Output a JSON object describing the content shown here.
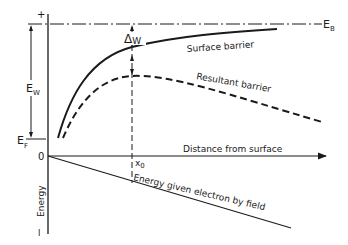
{
  "diagram": {
    "labels": {
      "plus": "+",
      "minus": "I",
      "e_b_main": "E",
      "e_b_sub": "B",
      "e_w_main": "E",
      "e_w_sub": "W",
      "e_f_main": "E",
      "e_f_sub": "F",
      "delta_main": "Δ",
      "delta_sub": "W",
      "zero": "0",
      "x0_main": "x",
      "x0_sub": "0",
      "energy_axis": "Energy",
      "surface_barrier": "Surface barrier",
      "resultant_barrier": "Resultant barrier",
      "distance_axis": "Distance from surface",
      "field_line": "Energy given electron by field"
    },
    "colors": {
      "ink": "#1a1a1a",
      "background": "#ffffff"
    }
  }
}
